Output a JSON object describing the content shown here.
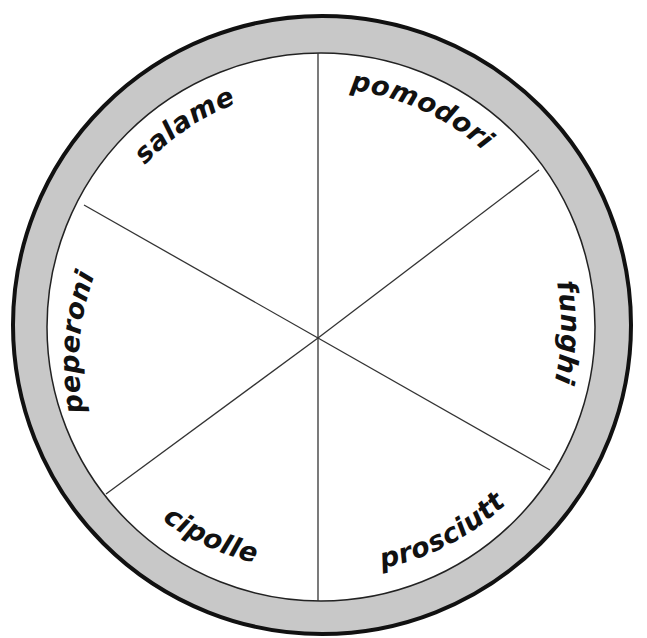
{
  "diagram": {
    "type": "pizza-wheel",
    "title": "",
    "colors": {
      "crust": "#c8c8c8",
      "crust_outline": "#111111",
      "inner_fill": "#ffffff",
      "divider": "#333333",
      "label": "#111111"
    },
    "slices": [
      {
        "id": "pomodori",
        "label": "pomodori"
      },
      {
        "id": "funghi",
        "label": "funghi"
      },
      {
        "id": "prosciutto",
        "label": "prosciutto"
      },
      {
        "id": "cipolle",
        "label": "cipolle"
      },
      {
        "id": "peperoni",
        "label": "peperoni"
      },
      {
        "id": "salame",
        "label": "salame"
      }
    ]
  }
}
